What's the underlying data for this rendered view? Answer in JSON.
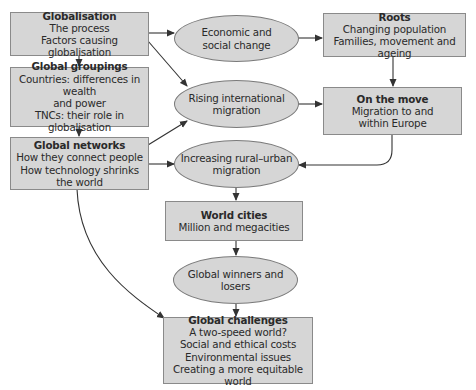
{
  "nodes": {
    "globalisation": {
      "title": "Globalisation",
      "lines": [
        "The process",
        "Factors causing globalisation"
      ]
    },
    "groupings": {
      "title": "Global groupings",
      "lines": [
        "Countries: differences in wealth",
        "and power",
        "TNCs: their role in",
        "globalisation"
      ]
    },
    "networks": {
      "title": "Global networks",
      "lines": [
        "How they connect people",
        "How technology shrinks",
        "the world"
      ]
    },
    "economic": {
      "lines": [
        "Economic and",
        "social change"
      ]
    },
    "rising": {
      "lines": [
        "Rising international",
        "migration"
      ]
    },
    "rural": {
      "lines": [
        "Increasing rural–urban",
        "migration"
      ]
    },
    "roots": {
      "title": "Roots",
      "lines": [
        "Changing population",
        "Families, movement and ageing"
      ]
    },
    "move": {
      "title": "On the move",
      "lines": [
        "Migration to and",
        "within Europe"
      ]
    },
    "cities": {
      "title": "World cities",
      "lines": [
        "Million and megacities"
      ]
    },
    "winners": {
      "lines": [
        "Global winners and losers"
      ]
    },
    "challenges": {
      "title": "Global challenges",
      "lines": [
        "A two-speed world?",
        "Social and ethical costs",
        "Environmental issues",
        "Creating a more equitable world"
      ]
    }
  },
  "colors": {
    "fill": "#d6d6d6",
    "border": "#8a8a8a",
    "line": "#333333"
  }
}
